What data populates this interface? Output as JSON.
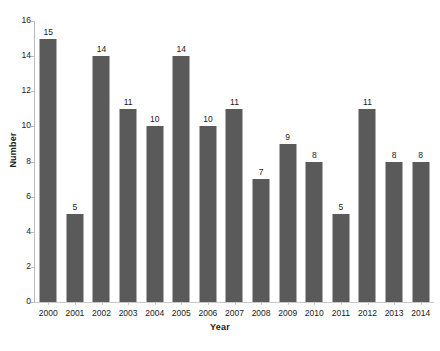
{
  "chart_data": {
    "type": "bar",
    "title": "",
    "xlabel": "Year",
    "ylabel": "Number",
    "categories": [
      "2000",
      "2001",
      "2002",
      "2003",
      "2004",
      "2005",
      "2006",
      "2007",
      "2008",
      "2009",
      "2010",
      "2011",
      "2012",
      "2013",
      "2014"
    ],
    "values": [
      15,
      5,
      14,
      11,
      10,
      14,
      10,
      11,
      7,
      9,
      8,
      5,
      11,
      8,
      8
    ],
    "value_labels": [
      "15",
      "5",
      "14",
      "11",
      "10",
      "14",
      "10",
      "11",
      "7",
      "9",
      "8",
      "5",
      "11",
      "8",
      "8"
    ],
    "ylim": [
      0,
      16
    ],
    "ytick_values": [
      0,
      2,
      4,
      6,
      8,
      10,
      12,
      14,
      16
    ],
    "ytick_labels": [
      "0",
      "2",
      "4",
      "6",
      "8",
      "10",
      "12",
      "14",
      "16"
    ],
    "grid": false,
    "legend": false,
    "bar_color": "#5a5a5a",
    "axis_color": "#bdbdbd",
    "text_color": "#1a1a1a",
    "background": "#ffffff"
  }
}
